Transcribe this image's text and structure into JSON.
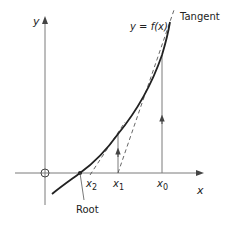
{
  "diagram": {
    "labels": {
      "y_axis": "y",
      "x_axis": "x",
      "curve": "y = f(x)",
      "tangent": "Tangent",
      "x0": "x",
      "x0_sub": "0",
      "x1": "x",
      "x1_sub": "1",
      "x2": "x",
      "x2_sub": "2",
      "root": "Root"
    },
    "colors": {
      "axis": "#777777",
      "curve": "#222222",
      "tangent": "#555555",
      "text": "#222222"
    }
  }
}
